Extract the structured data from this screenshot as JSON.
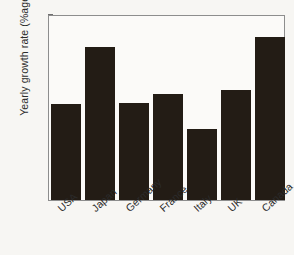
{
  "chart_data": {
    "type": "bar",
    "title": "",
    "xlabel": "",
    "ylabel": "Yearly growth rate (%age)",
    "categories": [
      "USA",
      "Japan",
      "Germany",
      "France",
      "Italy",
      "UK",
      "Canada"
    ],
    "values": [
      2.54,
      3.16,
      2.55,
      2.65,
      2.27,
      2.69,
      3.26
    ],
    "ylim": [
      1.5,
      3.5
    ],
    "yticks": [
      "1.5",
      "2",
      "2.5",
      "3",
      "3.5"
    ],
    "ytick_values": [
      1.5,
      2,
      2.5,
      3,
      3.5
    ],
    "grid": false,
    "legend": false,
    "legend_position": "none",
    "bar_color": "#231c15",
    "background_color": "#f7f6f3",
    "axis_color": "#8d8d8d",
    "xtick_rotation": -42
  }
}
